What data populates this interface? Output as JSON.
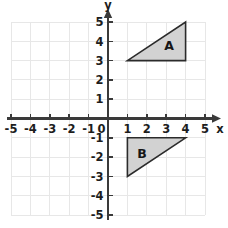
{
  "figure": {
    "background_color": "#ffffff"
  },
  "chart_data": {
    "type": "scatter",
    "title": "",
    "xlabel": "x",
    "ylabel": "y",
    "xlim": [
      -5,
      5
    ],
    "ylim": [
      -5,
      5
    ],
    "grid": true,
    "legend": "none",
    "x_tick_labels": [
      "-5",
      "-4",
      "-3",
      "-2",
      "-1",
      "1",
      "2",
      "3",
      "4",
      "5"
    ],
    "x_tick_values": [
      -5,
      -4,
      -3,
      -2,
      -1,
      1,
      2,
      3,
      4,
      5
    ],
    "y_tick_labels": [
      "5",
      "4",
      "3",
      "2",
      "1",
      "-1",
      "-2",
      "-3",
      "-4",
      "-5"
    ],
    "y_tick_values": [
      5,
      4,
      3,
      2,
      1,
      -1,
      -2,
      -3,
      -4,
      -5
    ],
    "origin_label": "0",
    "grid_color": "#e7e7e7",
    "axis_color": "#3a3a3a",
    "shape_fill_color": "#d2d2d2",
    "shape_stroke_color": "#2b2b2b",
    "shapes": [
      {
        "label": "A",
        "kind": "right-triangle",
        "vertices": [
          [
            1,
            3
          ],
          [
            4,
            3
          ],
          [
            4,
            5
          ]
        ],
        "label_position": [
          3.15,
          3.75
        ]
      },
      {
        "label": "B",
        "kind": "right-triangle",
        "vertices": [
          [
            1,
            -1
          ],
          [
            4,
            -1
          ],
          [
            1,
            -3
          ]
        ],
        "label_position": [
          1.75,
          -1.85
        ]
      }
    ]
  }
}
